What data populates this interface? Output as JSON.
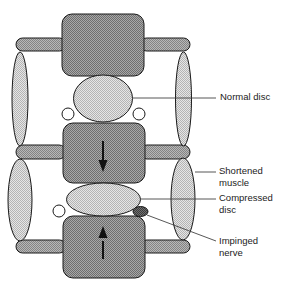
{
  "diagram": {
    "colors": {
      "vertebra_fill": "#8c8c8c",
      "disc_fill": "#d2d2d2",
      "muscle_fill": "#c8c8c8",
      "rod_fill": "#9a9a9a",
      "nerve_fill": "#555555",
      "outline": "#1a1a1a",
      "leader_line": "#444444"
    },
    "labels": {
      "normal_disc": "Normal disc",
      "shortened_muscle_line1": "Shortened",
      "shortened_muscle_line2": "muscle",
      "compressed_disc_line1": "Compressed",
      "compressed_disc_line2": "disc",
      "impinged_nerve_line1": "Impinged",
      "impinged_nerve_line2": "nerve"
    },
    "arrows": {
      "middle_vertebra": "down",
      "bottom_vertebra": "up"
    }
  }
}
